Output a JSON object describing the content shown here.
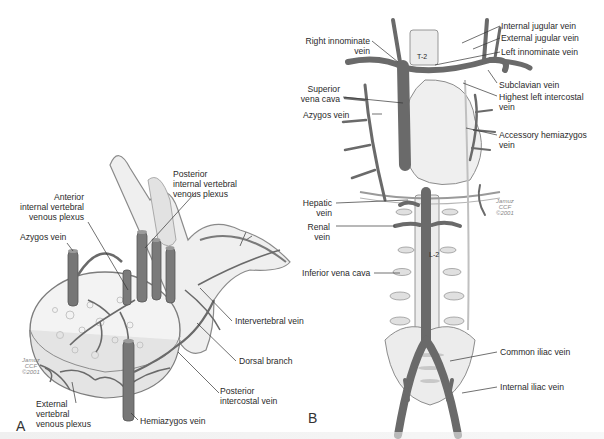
{
  "figure": {
    "panel_a": {
      "letter": "A",
      "labels": {
        "posterior_internal_plexus": [
          "Posterior",
          "internal vertebral",
          "venous plexus"
        ],
        "anterior_internal_plexus": [
          "Anterior",
          "internal vertebral",
          "venous plexus"
        ],
        "azygos_vein": "Azygos vein",
        "intervertebral_vein": "Intervertebral vein",
        "dorsal_branch": "Dorsal branch",
        "posterior_intercostal_vein": [
          "Posterior",
          "intercostal vein"
        ],
        "external_plexus": [
          "External",
          "vertebral",
          "venous plexus"
        ],
        "hemiazygos_vein": "Hemiazygos vein"
      },
      "signature": [
        "Jamuz",
        "CCF",
        "©2001"
      ]
    },
    "panel_b": {
      "letter": "B",
      "labels": {
        "right_innominate": [
          "Right innominate",
          "vein"
        ],
        "superior_vena_cava": [
          "Superior",
          "vena cava"
        ],
        "azygos_vein": "Azygos vein",
        "internal_jugular": "Internal jugular vein",
        "external_jugular": "External jugular vein",
        "left_innominate": "Left innominate vein",
        "subclavian": "Subclavian vein",
        "highest_left_intercostal": [
          "Highest left intercostal",
          "vein"
        ],
        "accessory_hemiazygos": [
          "Accessory hemiazygos",
          "vein"
        ],
        "hepatic_vein": [
          "Hepatic",
          "vein"
        ],
        "renal_vein": [
          "Renal",
          "vein"
        ],
        "inferior_vena_cava": "Inferior vena cava",
        "common_iliac": "Common iliac vein",
        "internal_iliac": "Internal iliac vein"
      },
      "vertebra_labels": {
        "thoracic": "T-2",
        "lumbar": "L-2"
      },
      "signature": [
        "Jamuz",
        "CCF",
        "©2001"
      ]
    },
    "colors": {
      "vein": "#6a6a6a",
      "bone": "#ededed",
      "bone_outline": "#8a8a8a",
      "leader": "#333333"
    }
  }
}
